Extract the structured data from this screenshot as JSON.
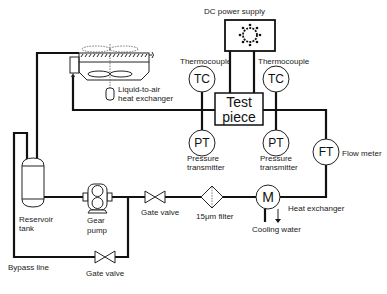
{
  "diagram": {
    "labels": {
      "dc_power_supply": "DC power supply",
      "thermocouple_left": "Thermocouple",
      "thermocouple_right": "Thermocouple",
      "tc_symbol": "TC",
      "pt_symbol": "PT",
      "ft_symbol": "FT",
      "hx_symbol": "M",
      "test_piece_line1": "Test",
      "test_piece_line2": "piece",
      "pressure_left_line1": "Pressure",
      "pressure_left_line2": "transmitter",
      "pressure_right_line1": "Pressure",
      "pressure_right_line2": "transmitter",
      "flow_meter": "Flow meter",
      "liquid_air_line1": "Liquid-to-air",
      "liquid_air_line2": "heat exchanger",
      "reservoir_line1": "Reservoir",
      "reservoir_line2": "tank",
      "gear_pump_line1": "Gear",
      "gear_pump_line2": "pump",
      "gate_valve_main": "Gate valve",
      "filter": "15μm filter",
      "heat_exchanger": "Heat exchanger",
      "cooling_water": "Cooling water",
      "bypass_line": "Bypass line",
      "gate_valve_bypass": "Gate valve"
    },
    "components": [
      {
        "id": "dc-power-supply",
        "type": "power-supply"
      },
      {
        "id": "thermocouple-left",
        "type": "instrument",
        "symbol": "TC"
      },
      {
        "id": "thermocouple-right",
        "type": "instrument",
        "symbol": "TC"
      },
      {
        "id": "test-piece",
        "type": "box"
      },
      {
        "id": "pressure-transmitter-left",
        "type": "instrument",
        "symbol": "PT"
      },
      {
        "id": "pressure-transmitter-right",
        "type": "instrument",
        "symbol": "PT"
      },
      {
        "id": "flow-meter",
        "type": "instrument",
        "symbol": "FT"
      },
      {
        "id": "heat-exchanger",
        "type": "heat-exchanger",
        "symbol": "M"
      },
      {
        "id": "filter",
        "type": "filter"
      },
      {
        "id": "gate-valve-main",
        "type": "valve"
      },
      {
        "id": "gear-pump",
        "type": "pump"
      },
      {
        "id": "reservoir-tank",
        "type": "tank"
      },
      {
        "id": "gate-valve-bypass",
        "type": "valve"
      },
      {
        "id": "liquid-to-air-heat-exchanger",
        "type": "radiator"
      }
    ]
  }
}
